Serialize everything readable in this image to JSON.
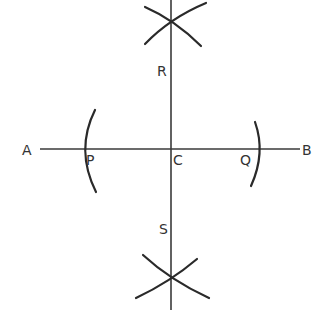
{
  "diagram": {
    "stroke_color": "#2a2a2a",
    "text_color": "#333333",
    "labels": {
      "A": "A",
      "B": "B",
      "C": "C",
      "P": "P",
      "Q": "Q",
      "R": "R",
      "S": "S"
    },
    "points": {
      "A": {
        "x": 30,
        "y": 149
      },
      "B": {
        "x": 306,
        "y": 149
      },
      "C": {
        "x": 171,
        "y": 149
      },
      "P": {
        "x": 85,
        "y": 149
      },
      "Q": {
        "x": 259,
        "y": 149
      },
      "top_intersection": {
        "x": 171,
        "y": 22
      },
      "bottom_intersection": {
        "x": 171,
        "y": 280
      }
    },
    "lines": [
      {
        "name": "AB",
        "from": "A",
        "to": "B"
      },
      {
        "name": "perpendicular",
        "description": "vertical line through C, R, S"
      }
    ],
    "arcs": [
      {
        "name": "arc-through-P",
        "center_hint": "C"
      },
      {
        "name": "arc-through-Q",
        "center_hint": "C"
      },
      {
        "name": "top-arc-from-P"
      },
      {
        "name": "top-arc-from-Q"
      },
      {
        "name": "bottom-arc-from-P"
      },
      {
        "name": "bottom-arc-from-Q"
      }
    ]
  }
}
